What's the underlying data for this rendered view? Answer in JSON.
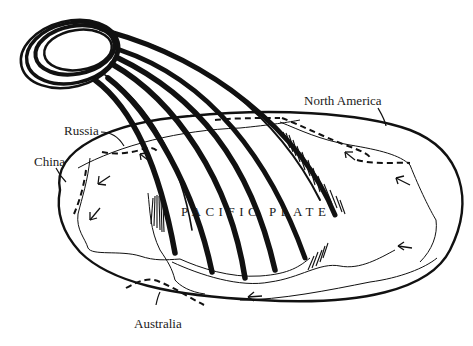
{
  "diagram": {
    "type": "sketch-map",
    "colors": {
      "ink": "#111111",
      "background": "#ffffff"
    },
    "labels": {
      "north_america": "North America",
      "russia": "Russia",
      "china": "China",
      "australia": "Australia",
      "pacific_plate": "PACIFIC PLATE"
    },
    "elements": {
      "globe_outline": "ellipse",
      "ring": "looped-rope-ring",
      "strands_count": 6,
      "subduction_boundaries": "dashed",
      "motion_arrows_count": 7
    }
  }
}
